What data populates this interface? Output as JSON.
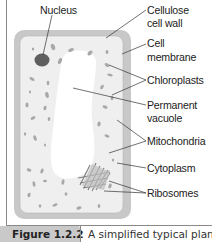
{
  "figure": {
    "number": "Figure 1.2.2",
    "caption": "A simplified typical plant"
  },
  "labels": {
    "nucleus": "Nucleus",
    "cell_wall_line1": "Cellulose",
    "cell_wall_line2": "cell wall",
    "membrane_line1": "Cell",
    "membrane_line2": "membrane",
    "chloroplasts": "Chloroplasts",
    "vacuole_line1": "Permanent",
    "vacuole_line2": "vacuole",
    "mitochondria": "Mitochondria",
    "cytoplasm": "Cytoplasm",
    "ribosomes": "Ribosomes"
  },
  "colors": {
    "cell_wall": "#c8c8c8",
    "cytoplasm": "#efefef",
    "vacuole": "#ffffff",
    "nucleus": "#5f5f5f",
    "organelle": "#a8a8a8",
    "leader_line": "#333333",
    "caption_tab": "#c9c9c9"
  }
}
